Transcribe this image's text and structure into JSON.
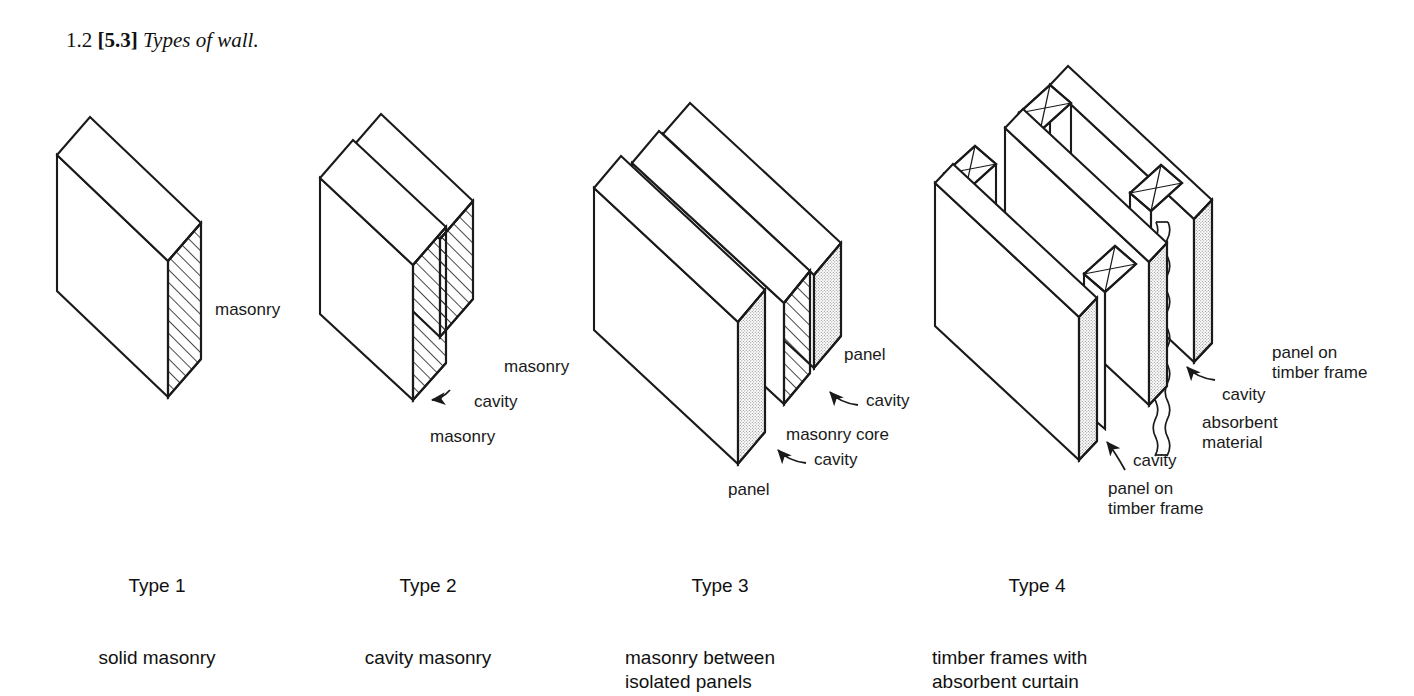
{
  "figure": {
    "caption_number": "1.2",
    "caption_bracket": "[5.3]",
    "caption_title": "Types of wall."
  },
  "types": [
    {
      "id": "type-1",
      "name": "Type 1",
      "description": "solid masonry",
      "callouts": [
        {
          "id": "masonry",
          "text": "masonry"
        }
      ]
    },
    {
      "id": "type-2",
      "name": "Type 2",
      "description": "cavity masonry",
      "callouts": [
        {
          "id": "masonry-rear",
          "text": "masonry"
        },
        {
          "id": "cavity",
          "text": "cavity"
        },
        {
          "id": "masonry-front",
          "text": "masonry"
        }
      ]
    },
    {
      "id": "type-3",
      "name": "Type 3",
      "description": "masonry between\nisolated panels",
      "callouts": [
        {
          "id": "panel-rear",
          "text": "panel"
        },
        {
          "id": "cavity-rear",
          "text": "cavity"
        },
        {
          "id": "masonry-core",
          "text": "masonry core"
        },
        {
          "id": "cavity-front",
          "text": "cavity"
        },
        {
          "id": "panel-front",
          "text": "panel"
        }
      ]
    },
    {
      "id": "type-4",
      "name": "Type 4",
      "description": "timber frames with\nabsorbent curtain",
      "callouts": [
        {
          "id": "panel-on-timber-frame-rear",
          "text": "panel on\ntimber frame"
        },
        {
          "id": "cavity-rear",
          "text": "cavity"
        },
        {
          "id": "absorbent-material",
          "text": "absorbent\nmaterial"
        },
        {
          "id": "cavity-front",
          "text": "cavity"
        },
        {
          "id": "panel-on-timber-frame-front",
          "text": "panel on\ntimber frame"
        }
      ]
    }
  ],
  "colors": {
    "ink": "#1a1a1a",
    "paper": "#ffffff",
    "hatch": "#1a1a1a",
    "stipple": "#9a9a9a"
  }
}
